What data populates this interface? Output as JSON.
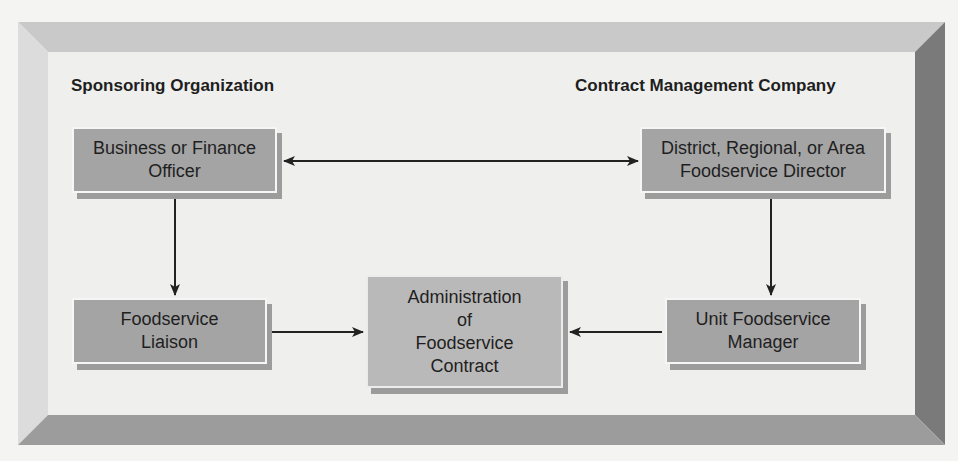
{
  "diagram": {
    "headings": {
      "left": "Sponsoring Organization",
      "right": "Contract Management Company"
    },
    "nodes": [
      {
        "id": "business-finance-officer",
        "label": "Business or Finance\nOfficer"
      },
      {
        "id": "district-director",
        "label": "District, Regional, or Area\nFoodservice Director"
      },
      {
        "id": "foodservice-liaison",
        "label": "Foodservice\nLiaison"
      },
      {
        "id": "administration",
        "label": "Administration\nof\nFoodservice\nContract"
      },
      {
        "id": "unit-manager",
        "label": "Unit Foodservice\nManager"
      }
    ],
    "edges": [
      {
        "from": "business-finance-officer",
        "to": "district-director",
        "bidirectional": true
      },
      {
        "from": "business-finance-officer",
        "to": "foodservice-liaison"
      },
      {
        "from": "district-director",
        "to": "unit-manager"
      },
      {
        "from": "foodservice-liaison",
        "to": "administration"
      },
      {
        "from": "unit-manager",
        "to": "administration"
      }
    ],
    "colors": {
      "node_dark": "#a4a4a4",
      "node_center": "#b9b9b9",
      "frame_right": "#7a7a7a",
      "frame_bottom": "#9c9c9c",
      "frame_top": "#c9c9c9",
      "frame_left": "#dcdcdc",
      "face": "#efefed",
      "arrow": "#222222"
    }
  }
}
